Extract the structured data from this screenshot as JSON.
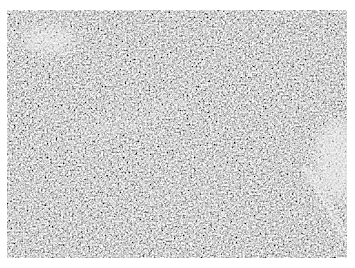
{
  "image": {
    "type": "micrograph",
    "description": "Grayscale histology section showing densely packed small round cells with scattered lighter stromal areas; fibrous streak at right edge",
    "colors": {
      "background": "#ffffff",
      "tissue_base": "#9a9a9a",
      "light_stroma": "#e6e6e6",
      "dark_nuclei": "#5a5a5a"
    }
  }
}
